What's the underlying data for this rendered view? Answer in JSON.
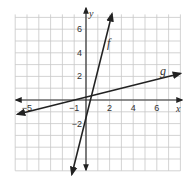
{
  "chart_data": {
    "type": "line",
    "title": "",
    "xlabel": "x",
    "ylabel": "y",
    "xlim": [
      -6,
      8
    ],
    "ylim": [
      -6,
      7
    ],
    "grid": true,
    "x_ticks": [
      {
        "value": -5,
        "label": "−5"
      },
      {
        "value": -1,
        "label": "−1"
      },
      {
        "value": 2,
        "label": "2"
      },
      {
        "value": 4,
        "label": "4"
      },
      {
        "value": 6,
        "label": "6"
      }
    ],
    "y_ticks": [
      {
        "value": 6,
        "label": "6"
      },
      {
        "value": 4,
        "label": "4"
      },
      {
        "value": 2,
        "label": "2"
      },
      {
        "value": -2,
        "label": "−2"
      }
    ],
    "series": [
      {
        "name": "f",
        "slope": 4,
        "intercept": -1.5,
        "x": [
          -1.2,
          2.2
        ],
        "y": [
          -6.3,
          7.3
        ]
      },
      {
        "name": "g",
        "slope": 0.25,
        "intercept": 0.25,
        "x": [
          -5.8,
          8
        ],
        "y": [
          -1.2,
          2.25
        ]
      }
    ],
    "colors": {
      "line": "#222222",
      "grid": "#c8c8c8",
      "axis": "#333333"
    }
  },
  "labels": {
    "x_axis": "x",
    "y_axis": "y",
    "f": "f",
    "g": "g"
  }
}
